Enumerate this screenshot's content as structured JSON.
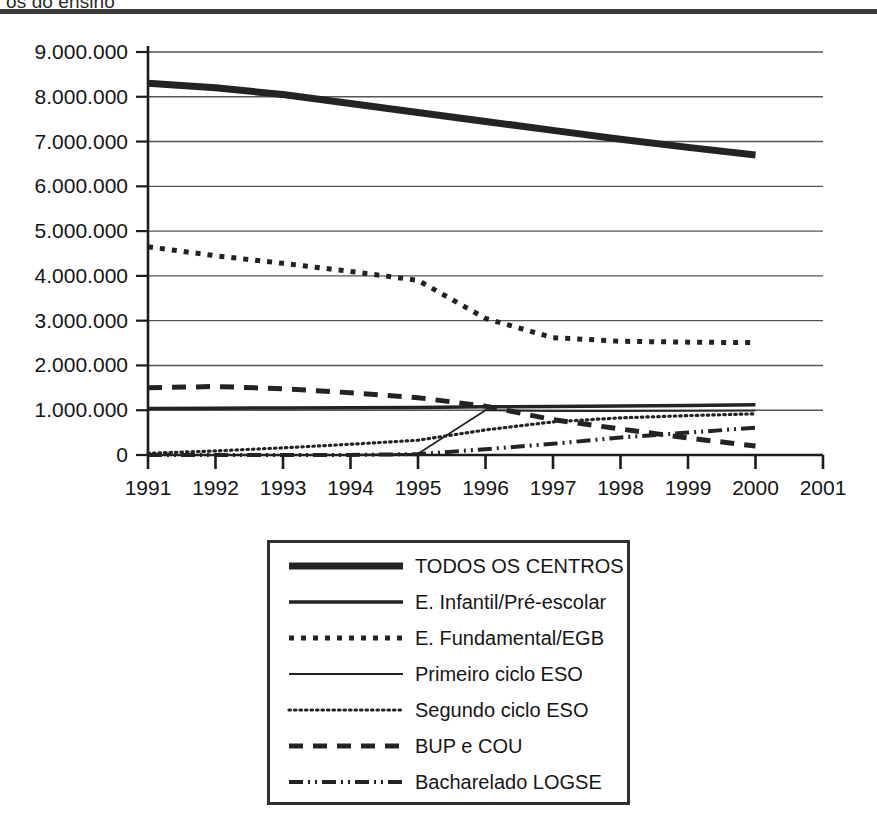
{
  "header": {
    "title_truncated": "os do ensino",
    "rule_color": "#3a3a3a"
  },
  "chart_data": {
    "type": "line",
    "title": "",
    "xlabel": "",
    "ylabel": "",
    "x": [
      1991,
      1992,
      1993,
      1994,
      1995,
      1996,
      1997,
      1998,
      1999,
      2000
    ],
    "xlim": [
      1991,
      2001
    ],
    "ylim": [
      0,
      9000000
    ],
    "xticks": [
      1991,
      1992,
      1993,
      1994,
      1995,
      1996,
      1997,
      1998,
      1999,
      2000,
      2001
    ],
    "xtick_labels": [
      "1991",
      "1992",
      "1993",
      "1994",
      "1995",
      "1996",
      "1997",
      "1998",
      "1999",
      "2000",
      "2001"
    ],
    "yticks": [
      0,
      1000000,
      2000000,
      3000000,
      4000000,
      5000000,
      6000000,
      7000000,
      8000000,
      9000000
    ],
    "ytick_labels": [
      "0",
      "1.000.000",
      "2.000.000",
      "3.000.000",
      "4.000.000",
      "5.000.000",
      "6.000.000",
      "7.000.000",
      "8.000.000",
      "9.000.000"
    ],
    "grid": "horizontal",
    "legend_position": "below-center",
    "line_color": "#232323",
    "series": [
      {
        "name": "TODOS OS CENTROS",
        "style": "solid-thick",
        "width": 7,
        "dash": "",
        "values": [
          8300000,
          8200000,
          8050000,
          7850000,
          7650000,
          7450000,
          7250000,
          7050000,
          6870000,
          6700000
        ]
      },
      {
        "name": "E. Infantil/Pré-escolar",
        "style": "solid-medium",
        "width": 3.5,
        "dash": "",
        "values": [
          1040000,
          1045000,
          1050000,
          1055000,
          1060000,
          1075000,
          1085000,
          1095000,
          1105000,
          1120000
        ]
      },
      {
        "name": "E. Fundamental/EGB",
        "style": "dotted-square",
        "width": 5,
        "dash": "5,7",
        "values": [
          4650000,
          4450000,
          4280000,
          4100000,
          3900000,
          3050000,
          2620000,
          2540000,
          2520000,
          2510000
        ]
      },
      {
        "name": "Primeiro ciclo ESO",
        "style": "solid-thin",
        "width": 1.8,
        "dash": "",
        "values": [
          0,
          0,
          0,
          0,
          30000,
          1000000,
          980000,
          980000,
          985000,
          990000
        ]
      },
      {
        "name": "Segundo ciclo ESO",
        "style": "fine-dotted",
        "width": 3.2,
        "dash": "1.5,4",
        "values": [
          40000,
          90000,
          160000,
          240000,
          330000,
          560000,
          740000,
          830000,
          880000,
          920000
        ]
      },
      {
        "name": "BUP e COU",
        "style": "dashed-long",
        "width": 5,
        "dash": "14,10",
        "values": [
          1500000,
          1530000,
          1480000,
          1390000,
          1280000,
          1090000,
          790000,
          580000,
          380000,
          200000
        ]
      },
      {
        "name": "Bacharelado LOGSE",
        "style": "dash-dot-dot",
        "width": 4,
        "dash": "14,5,2,5,2,5",
        "values": [
          0,
          0,
          0,
          0,
          20000,
          130000,
          250000,
          390000,
          500000,
          610000
        ]
      }
    ]
  }
}
